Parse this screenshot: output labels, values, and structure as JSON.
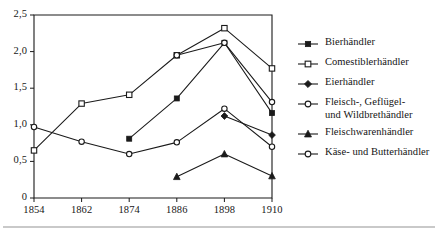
{
  "chart_data": {
    "type": "line",
    "title": "",
    "subtitle": "",
    "xlabel": "",
    "ylabel": "",
    "x": [
      1854,
      1862,
      1874,
      1886,
      1898,
      1910
    ],
    "xtick_labels": [
      "1854",
      "1862",
      "1874",
      "1886",
      "1898",
      "1910"
    ],
    "ytick_labels": [
      "0",
      "0,5",
      "1,0",
      "1,5",
      "2,0",
      "2,5"
    ],
    "ytick_values": [
      0,
      0.5,
      1.0,
      1.5,
      2.0,
      2.5
    ],
    "ylim": [
      0,
      2.5
    ],
    "xlim": [
      1854,
      1910
    ],
    "grid": false,
    "legend_position": "right",
    "decimal_separator": ",",
    "line_color": "#1a1a1a",
    "series": [
      {
        "name": "Bierhändler",
        "marker": "filled-square",
        "values": [
          null,
          null,
          0.81,
          1.36,
          2.12,
          1.16
        ]
      },
      {
        "name": "Comestiblerhändler",
        "marker": "open-square",
        "values": [
          0.65,
          1.29,
          1.41,
          1.95,
          2.32,
          1.77
        ]
      },
      {
        "name": "Eierhändler",
        "marker": "filled-diamond",
        "values": [
          null,
          null,
          null,
          null,
          1.12,
          0.86
        ]
      },
      {
        "name": "Fleisch-, Geflügel-\nund Wildbrethändler",
        "marker": "open-circle",
        "values": [
          0.97,
          0.77,
          0.6,
          0.76,
          1.22,
          0.7
        ]
      },
      {
        "name": "Fleischwarenhändler",
        "marker": "filled-triangle",
        "values": [
          null,
          null,
          null,
          0.29,
          0.6,
          0.3
        ]
      },
      {
        "name": "Käse- und Butterhändler",
        "marker": "open-circle",
        "values": [
          null,
          null,
          null,
          1.95,
          2.12,
          1.31
        ]
      }
    ]
  },
  "legend": {
    "items": [
      {
        "label": "Bierhändler",
        "marker": "filled-square"
      },
      {
        "label": "Comestiblerhändler",
        "marker": "open-square"
      },
      {
        "label": "Eierhändler",
        "marker": "filled-diamond"
      },
      {
        "label": "Fleisch-, Geflügel-\nund Wildbrethändler",
        "marker": "open-circle"
      },
      {
        "label": "Fleischwarenhändler",
        "marker": "filled-triangle"
      },
      {
        "label": "Käse- und Butterhändler",
        "marker": "open-circle"
      }
    ]
  }
}
